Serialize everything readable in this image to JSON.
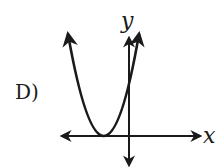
{
  "choice": {
    "label": "D)"
  },
  "graph": {
    "x_axis_label": "x",
    "y_axis_label": "y",
    "curve": "upward-opening parabola with vertex on the negative x-axis",
    "colors": {
      "stroke": "#1a1a1a",
      "background": "#ffffff"
    }
  }
}
